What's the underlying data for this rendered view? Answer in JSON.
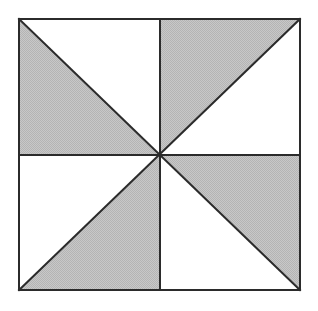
{
  "figure": {
    "type": "geometric-diagram",
    "canvas": {
      "width": 318,
      "height": 311,
      "background": "#ffffff"
    },
    "square": {
      "left": 19,
      "top": 19,
      "right": 300,
      "bottom": 290,
      "width": 281,
      "height": 271,
      "stroke_color": "#2b2b2b",
      "stroke_width": 2
    },
    "center": {
      "x": 160,
      "y": 155
    },
    "colors": {
      "shaded_fill": "#c2c2c2",
      "shaded_dither": "#9a9a9a",
      "unshaded_fill": "#ffffff",
      "line": "#2b2b2b",
      "background": "#ffffff"
    },
    "lines": [
      {
        "name": "vertical-midline",
        "x1": 160,
        "y1": 19,
        "x2": 160,
        "y2": 290
      },
      {
        "name": "horizontal-midline",
        "x1": 19,
        "y1": 155,
        "x2": 300,
        "y2": 155
      },
      {
        "name": "diagonal-tl-br",
        "x1": 19,
        "y1": 19,
        "x2": 300,
        "y2": 290
      },
      {
        "name": "diagonal-tr-bl",
        "x1": 300,
        "y1": 19,
        "x2": 19,
        "y2": 290
      }
    ],
    "sector_count": 8,
    "shaded_sector_count": 4,
    "unshaded_sector_count": 4,
    "shaded_fraction_label": "1/2",
    "sectors": [
      {
        "id": "tl-upper",
        "quadrant": "top-left",
        "half": "upper-right",
        "shaded": false,
        "points": "19,19 160,19 160,155"
      },
      {
        "id": "tl-lower",
        "quadrant": "top-left",
        "half": "lower-left",
        "shaded": true,
        "points": "19,19 160,155 19,155"
      },
      {
        "id": "tr-upper",
        "quadrant": "top-right",
        "half": "upper-left",
        "shaded": true,
        "points": "160,19 300,19 160,155"
      },
      {
        "id": "tr-lower",
        "quadrant": "top-right",
        "half": "lower-right",
        "shaded": false,
        "points": "300,19 300,155 160,155"
      },
      {
        "id": "bl-upper",
        "quadrant": "bottom-left",
        "half": "upper-left",
        "shaded": false,
        "points": "19,155 160,155 19,290"
      },
      {
        "id": "bl-lower",
        "quadrant": "bottom-left",
        "half": "lower-right",
        "shaded": true,
        "points": "160,155 160,290 19,290"
      },
      {
        "id": "br-upper",
        "quadrant": "bottom-right",
        "half": "upper-right",
        "shaded": true,
        "points": "160,155 300,155 300,290"
      },
      {
        "id": "br-lower",
        "quadrant": "bottom-right",
        "half": "lower-left",
        "shaded": false,
        "points": "160,155 300,290 160,290"
      }
    ]
  }
}
